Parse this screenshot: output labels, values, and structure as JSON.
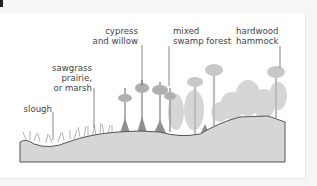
{
  "diagram": {
    "title": "",
    "zones": [
      {
        "id": "slough",
        "label": "slough"
      },
      {
        "id": "sawgrass",
        "label": "sawgrass\nprairie,\nor marsh"
      },
      {
        "id": "cypress",
        "label": "cypress\nand willow"
      },
      {
        "id": "mixed-swamp",
        "label": "mixed\nswamp forest"
      },
      {
        "id": "hardwood",
        "label": "hardwood\nhammock"
      }
    ],
    "colors": {
      "ground_fill": "#d6d6d6",
      "ground_outline": "#555555",
      "vegetation_dark": "#9a9a9a",
      "vegetation_light": "#c4c4c4",
      "leader_line": "#555555",
      "text": "#444444"
    }
  }
}
